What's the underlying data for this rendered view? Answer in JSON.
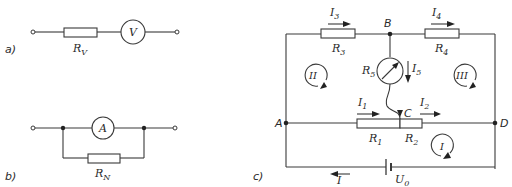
{
  "diagrams": {
    "a": {
      "caption": "a)",
      "resistor_label": "R",
      "resistor_sub": "V",
      "meter_symbol": "V"
    },
    "b": {
      "caption": "b)",
      "resistor_label": "R",
      "resistor_sub": "N",
      "meter_symbol": "A"
    },
    "c": {
      "caption": "c)",
      "nodes": {
        "A": "A",
        "B": "B",
        "C": "C",
        "D": "D"
      },
      "resistors": [
        {
          "label": "R",
          "sub": "1"
        },
        {
          "label": "R",
          "sub": "2"
        },
        {
          "label": "R",
          "sub": "3"
        },
        {
          "label": "R",
          "sub": "4"
        },
        {
          "label": "R",
          "sub": "5"
        }
      ],
      "currents": [
        {
          "label": "I",
          "sub": "1"
        },
        {
          "label": "I",
          "sub": "2"
        },
        {
          "label": "I",
          "sub": "3"
        },
        {
          "label": "I",
          "sub": "4"
        },
        {
          "label": "I",
          "sub": "5"
        },
        {
          "label": "I",
          "sub": ""
        }
      ],
      "source": {
        "label": "U",
        "sub": "0"
      },
      "loops": [
        "I",
        "II",
        "III"
      ]
    }
  }
}
